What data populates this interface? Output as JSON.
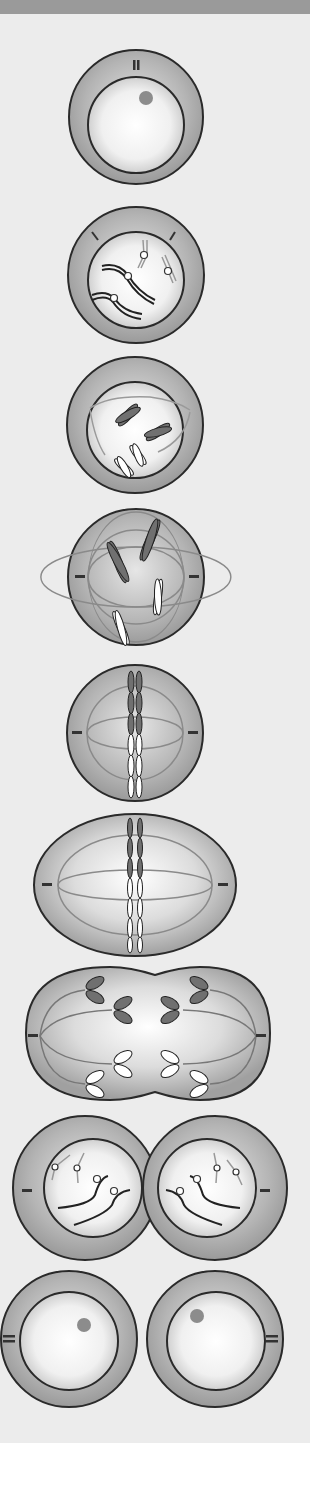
{
  "diagram": {
    "colors": {
      "header_bar": "#9a9a9a",
      "background": "#ececec",
      "cytoplasm": "#a8a8a8",
      "nucleus_light": "#ffffff",
      "outline": "#2a2a2a",
      "nucleolus": "#8c8c8c",
      "dark_chromosome": "#707070",
      "light_chromosome": "#ffffff",
      "spindle": "#8a8a8a"
    },
    "stages": [
      {
        "id": "interphase",
        "name": "Interphase"
      },
      {
        "id": "early-prophase",
        "name": "Early prophase"
      },
      {
        "id": "prophase",
        "name": "Prophase"
      },
      {
        "id": "prometaphase",
        "name": "Prometaphase"
      },
      {
        "id": "metaphase",
        "name": "Metaphase"
      },
      {
        "id": "anaphase-early",
        "name": "Early anaphase"
      },
      {
        "id": "anaphase",
        "name": "Anaphase"
      },
      {
        "id": "telophase",
        "name": "Telophase"
      },
      {
        "id": "cytokinesis",
        "name": "Cytokinesis"
      }
    ]
  }
}
